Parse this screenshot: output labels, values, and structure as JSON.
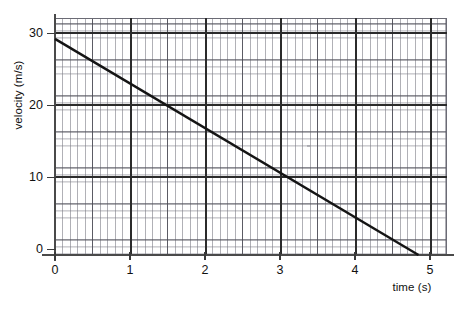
{
  "figure": {
    "background_color": "#ffffff",
    "line_color": "#141414",
    "grid_color": "#8a8a94",
    "major_grid_color": "#2b2b2b",
    "axis_color": "#4a4a4a"
  },
  "axes": {
    "x_title": "time (s)",
    "y_title": "velocity (m/s)",
    "x_tick_labels": [
      "0",
      "1",
      "2",
      "3",
      "4",
      "5"
    ],
    "y_tick_labels": [
      "0",
      "10",
      "20",
      "30"
    ]
  },
  "chart_data": {
    "type": "line",
    "title": "",
    "subtitle": "",
    "xlabel": "time (s)",
    "ylabel": "velocity (m/s)",
    "xlim": [
      0,
      5.23
    ],
    "ylim": [
      0,
      32.9
    ],
    "x_ticks": [
      0,
      1,
      2,
      3,
      4,
      5
    ],
    "y_ticks": [
      0,
      10,
      20,
      30
    ],
    "x_minor_step": 0.1,
    "y_minor_step": 1,
    "grid": true,
    "grid_style": "graph-paper",
    "legend": null,
    "legend_position": "none",
    "annotations": [],
    "series": [
      {
        "name": "velocity",
        "x": [
          0,
          4.85
        ],
        "y": [
          30,
          0
        ],
        "points": [
          {
            "x": 0,
            "y": 30
          },
          {
            "x": 1,
            "y": 23.8
          },
          {
            "x": 2,
            "y": 17.6
          },
          {
            "x": 3,
            "y": 11.3
          },
          {
            "x": 4,
            "y": 5.1
          },
          {
            "x": 4.85,
            "y": 0
          }
        ],
        "slope": -6.19,
        "intercept": 30,
        "units": "m/s per s"
      }
    ]
  }
}
